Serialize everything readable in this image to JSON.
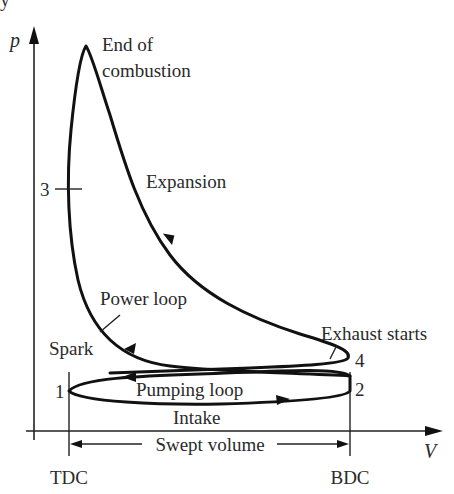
{
  "figure": {
    "type": "p-V indicator diagram (four-stroke spark-ignition engine)",
    "axes": {
      "y_label": "p",
      "x_label": "V"
    },
    "labels": {
      "end_of_combustion_line1": "End of",
      "end_of_combustion_line2": "combustion",
      "expansion": "Expansion",
      "power_loop": "Power loop",
      "spark": "Spark",
      "exhaust_starts": "Exhaust starts",
      "pumping_loop": "Pumping loop",
      "intake": "Intake",
      "swept_volume": "Swept volume",
      "tdc": "TDC",
      "bdc": "BDC"
    },
    "points": {
      "p1": "1",
      "p2": "2",
      "p3": "3",
      "p4": "4"
    },
    "top_cropped_text": "y"
  },
  "colors": {
    "line": "#111111",
    "text": "#2a2a2a",
    "background": "#ffffff"
  }
}
